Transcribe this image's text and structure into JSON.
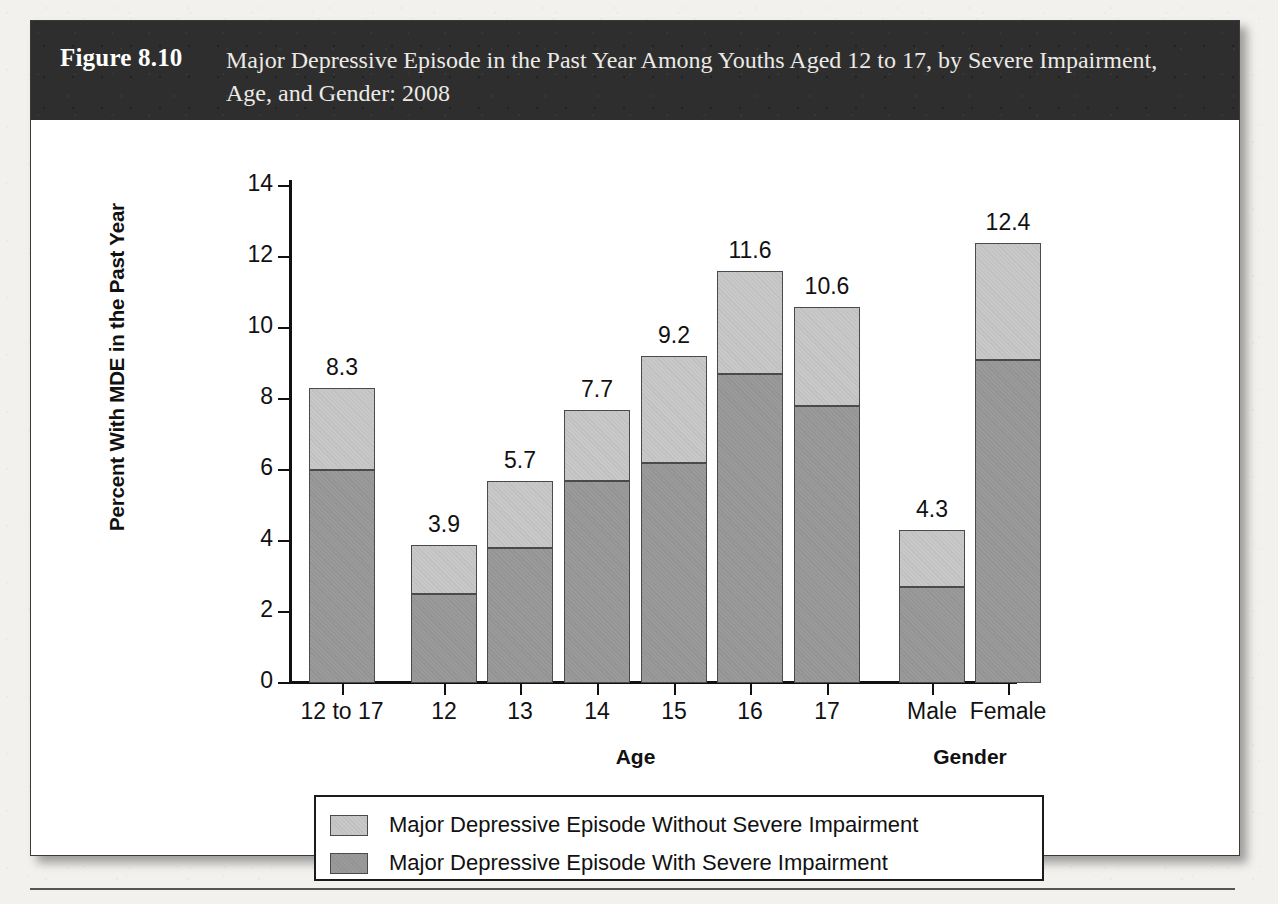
{
  "figure": {
    "number_label": "Figure 8.10",
    "caption": "Major Depressive Episode in the Past Year Among Youths Aged 12 to 17, by Severe Impairment, Age, and Gender: 2008"
  },
  "colors": {
    "band_background": "#2e2e2e",
    "band_text": "#eceae6",
    "page_background": "#f2f1ee",
    "figure_background": "#ffffff",
    "axis": "#111111",
    "series_without_impairment": "#c8c8c8",
    "series_with_impairment": "#9a9a9a",
    "segment_border": "#4a4a4a"
  },
  "chart_data": {
    "type": "bar",
    "subtype": "stacked",
    "title": "Major Depressive Episode in the Past Year Among Youths Aged 12 to 17, by Severe Impairment, Age, and Gender: 2008",
    "xlabel": "",
    "ylabel": "Percent With MDE in the Past Year",
    "ylim": [
      0,
      14
    ],
    "yticks": [
      0,
      2,
      4,
      6,
      8,
      10,
      12,
      14
    ],
    "ytick_labels": [
      "0",
      "2",
      "4",
      "6",
      "8",
      "10",
      "12",
      "14"
    ],
    "grid": false,
    "legend_position": "bottom",
    "categories": [
      "12 to 17",
      "12",
      "13",
      "14",
      "15",
      "16",
      "17",
      "Male",
      "Female"
    ],
    "group_labels": [
      {
        "label": "Age",
        "categories": [
          "12",
          "13",
          "14",
          "15",
          "16",
          "17"
        ]
      },
      {
        "label": "Gender",
        "categories": [
          "Male",
          "Female"
        ]
      }
    ],
    "series": [
      {
        "name": "Major Depressive Episode With Severe Impairment",
        "color": "#9a9a9a",
        "values": [
          6.0,
          2.5,
          3.8,
          5.7,
          6.2,
          8.7,
          7.8,
          2.7,
          9.1
        ]
      },
      {
        "name": "Major Depressive Episode Without Severe Impairment",
        "color": "#c8c8c8",
        "values": [
          2.3,
          1.4,
          1.9,
          2.0,
          3.0,
          2.9,
          2.8,
          1.6,
          3.3
        ]
      }
    ],
    "totals": [
      8.3,
      3.9,
      5.7,
      7.7,
      9.2,
      11.6,
      10.6,
      4.3,
      12.4
    ],
    "total_labels": [
      "8.3",
      "3.9",
      "5.7",
      "7.7",
      "9.2",
      "11.6",
      "10.6",
      "4.3",
      "12.4"
    ]
  },
  "legend": {
    "items": [
      {
        "label": "Major Depressive Episode Without Severe Impairment",
        "swatch": "#c8c8c8"
      },
      {
        "label": "Major Depressive Episode With Severe Impairment",
        "swatch": "#9a9a9a"
      }
    ]
  }
}
